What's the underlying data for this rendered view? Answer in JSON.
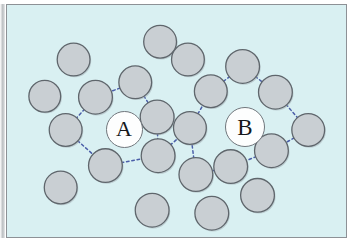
{
  "figure": {
    "type": "particle-packing-diagram",
    "background_color": "#d9f0f2",
    "frame_color": "#8d9196",
    "particle_fill": "#c9cfd3",
    "particle_stroke": "#5f666c",
    "bond_color": "#4b5ea8",
    "label_disc_fill": "#fdfefe",
    "label_disc_stroke": "#70767c",
    "width": 355,
    "height": 250
  },
  "labels": [
    {
      "id": "site-a",
      "text": "A",
      "cx": 122,
      "cy": 128,
      "r": 17.5,
      "font_size": 22
    },
    {
      "id": "site-b",
      "text": "B",
      "cx": 243,
      "cy": 126,
      "r": 19,
      "font_size": 23
    }
  ],
  "particles": [
    {
      "id": "p1",
      "cx": 160,
      "cy": 42,
      "r": 16.5
    },
    {
      "id": "p2",
      "cx": 73,
      "cy": 60,
      "r": 16.5
    },
    {
      "id": "p3",
      "cx": 188,
      "cy": 60,
      "r": 16.5
    },
    {
      "id": "p4",
      "cx": 243,
      "cy": 67,
      "r": 17.0
    },
    {
      "id": "p5",
      "cx": 135,
      "cy": 83,
      "r": 16.5
    },
    {
      "id": "p6",
      "cx": 44,
      "cy": 97,
      "r": 16.0
    },
    {
      "id": "p7",
      "cx": 95,
      "cy": 98,
      "r": 17.0
    },
    {
      "id": "p8",
      "cx": 211,
      "cy": 92,
      "r": 16.5
    },
    {
      "id": "p9",
      "cx": 276,
      "cy": 93,
      "r": 17.0
    },
    {
      "id": "p10",
      "cx": 157,
      "cy": 118,
      "r": 17.0
    },
    {
      "id": "p11",
      "cx": 65,
      "cy": 131,
      "r": 16.5
    },
    {
      "id": "p12",
      "cx": 190,
      "cy": 129,
      "r": 16.5
    },
    {
      "id": "p13",
      "cx": 309,
      "cy": 131,
      "r": 16.5
    },
    {
      "id": "p14",
      "cx": 158,
      "cy": 157,
      "r": 17.0
    },
    {
      "id": "p15",
      "cx": 272,
      "cy": 152,
      "r": 17.0
    },
    {
      "id": "p16",
      "cx": 105,
      "cy": 167,
      "r": 17.0
    },
    {
      "id": "p17",
      "cx": 196,
      "cy": 176,
      "r": 17.0
    },
    {
      "id": "p18",
      "cx": 231,
      "cy": 168,
      "r": 17.0
    },
    {
      "id": "p19",
      "cx": 60,
      "cy": 189,
      "r": 16.5
    },
    {
      "id": "p20",
      "cx": 152,
      "cy": 212,
      "r": 17.0
    },
    {
      "id": "p21",
      "cx": 212,
      "cy": 215,
      "r": 17.0
    },
    {
      "id": "p22",
      "cx": 258,
      "cy": 197,
      "r": 17.0
    }
  ],
  "bonds": [
    {
      "from": "p5",
      "to": "p7"
    },
    {
      "from": "p5",
      "to": "p10"
    },
    {
      "from": "p7",
      "to": "p11"
    },
    {
      "from": "p11",
      "to": "p16"
    },
    {
      "from": "p16",
      "to": "p14"
    },
    {
      "from": "p10",
      "to": "p14"
    },
    {
      "from": "p14",
      "to": "p12"
    },
    {
      "from": "p12",
      "to": "p8"
    },
    {
      "from": "p8",
      "to": "p4"
    },
    {
      "from": "p4",
      "to": "p9"
    },
    {
      "from": "p9",
      "to": "p13"
    },
    {
      "from": "p13",
      "to": "p15"
    },
    {
      "from": "p15",
      "to": "p18"
    },
    {
      "from": "p18",
      "to": "p17"
    },
    {
      "from": "p17",
      "to": "p12"
    }
  ]
}
